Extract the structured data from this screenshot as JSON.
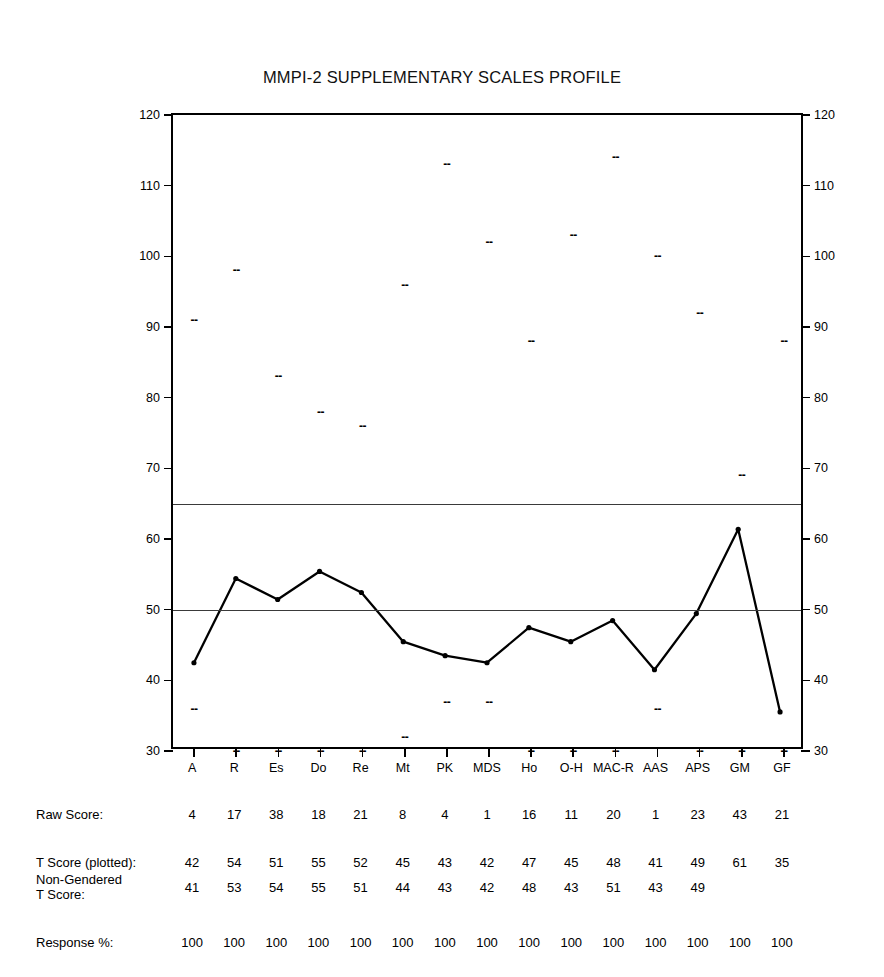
{
  "chart_data": {
    "type": "line",
    "title": "MMPI-2 SUPPLEMENTARY SCALES PROFILE",
    "xlabel": "",
    "ylabel": "",
    "ylim": [
      30,
      120
    ],
    "yticks": [
      30,
      40,
      50,
      60,
      70,
      80,
      90,
      100,
      110,
      120
    ],
    "grid": false,
    "legend": "none",
    "reference_lines": [
      65,
      50
    ],
    "categories": [
      "A",
      "R",
      "Es",
      "Do",
      "Re",
      "Mt",
      "PK",
      "MDS",
      "Ho",
      "O-H",
      "MAC-R",
      "AAS",
      "APS",
      "GM",
      "GF"
    ],
    "series": [
      {
        "name": "T Score (plotted)",
        "values": [
          42,
          54,
          51,
          55,
          52,
          45,
          43,
          42,
          47,
          45,
          48,
          41,
          49,
          61,
          35
        ]
      },
      {
        "name": "Upper percentile marker",
        "style": "dash",
        "values": [
          91,
          98,
          83,
          78,
          76,
          96,
          113,
          102,
          88,
          103,
          114,
          100,
          92,
          69,
          88
        ]
      },
      {
        "name": "Lower percentile marker",
        "style": "dash",
        "values": [
          36,
          30,
          30,
          30,
          30,
          32,
          37,
          37,
          30,
          30,
          30,
          36,
          30,
          30,
          30
        ]
      }
    ]
  },
  "table": {
    "rows": [
      {
        "label": "Raw Score:",
        "values": [
          "4",
          "17",
          "38",
          "18",
          "21",
          "8",
          "4",
          "1",
          "16",
          "11",
          "20",
          "1",
          "23",
          "43",
          "21"
        ]
      },
      {
        "label": "T Score (plotted):",
        "values": [
          "42",
          "54",
          "51",
          "55",
          "52",
          "45",
          "43",
          "42",
          "47",
          "45",
          "48",
          "41",
          "49",
          "61",
          "35"
        ]
      },
      {
        "label": "Non-Gendered\nT Score:",
        "values": [
          "41",
          "53",
          "54",
          "55",
          "51",
          "44",
          "43",
          "42",
          "48",
          "43",
          "51",
          "43",
          "49",
          "",
          ""
        ]
      },
      {
        "label": "Response %:",
        "values": [
          "100",
          "100",
          "100",
          "100",
          "100",
          "100",
          "100",
          "100",
          "100",
          "100",
          "100",
          "100",
          "100",
          "100",
          "100"
        ]
      }
    ]
  },
  "style": {
    "line_color": "#000000",
    "axis_color": "#000000",
    "reference_line_color": "#3a3a3a",
    "background": "#ffffff"
  }
}
